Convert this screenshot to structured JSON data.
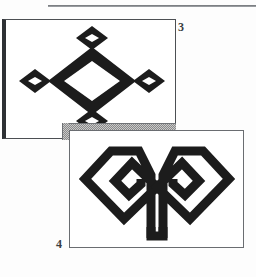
{
  "page": {
    "background_color": "#fdfdfd",
    "width": 256,
    "height": 277
  },
  "top_rule": {
    "name": "horizontal-rule",
    "color": "#6f7276"
  },
  "figures": [
    {
      "number": "3",
      "label": "3",
      "label_position": "right-top",
      "panel": {
        "fill": "#ffffff",
        "border_color": "#4c4f53",
        "shadow_edge_color": "#2e3134"
      },
      "motif": {
        "name": "diamond-star-motif",
        "description": "Large hollow diamond outline with four small hollow diamonds at top, bottom, left and right points",
        "ink_color": "#1c1c1c",
        "element_count": 5
      }
    },
    {
      "number": "4",
      "label": "4",
      "label_position": "left-bottom",
      "panel": {
        "fill": "#ffffff",
        "border_color": "#6a6d71"
      },
      "motif": {
        "name": "rams-horn-motif",
        "description": "Symmetric pair of angular spiral horns joined by a central U-shaped stem",
        "ink_color": "#1c1c1c",
        "element_count": 1
      }
    }
  ],
  "shadow": {
    "name": "panel-drop-shadow",
    "pattern": "dither-checkerboard",
    "color": "#8a8a8a"
  }
}
